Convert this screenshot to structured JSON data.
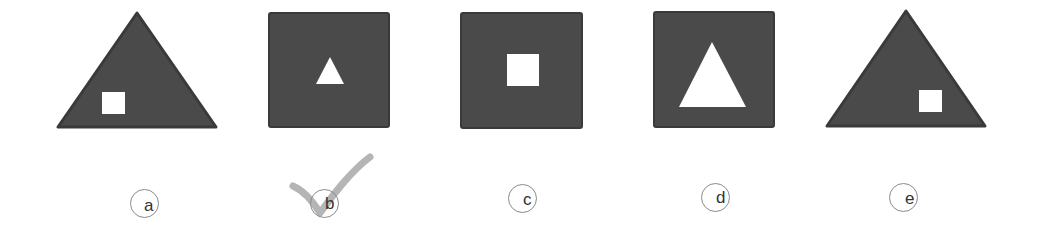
{
  "puzzle": {
    "colors": {
      "shape_fill": "#4a4a4a",
      "shape_stroke": "#3a3a3a",
      "inner_fill": "#ffffff",
      "circle_stroke": "#8a8a8a",
      "check_color": "#a8a8a8"
    },
    "options": [
      {
        "label": "a",
        "outer": "triangle",
        "inner": "square",
        "inner_position": "bottom-left",
        "selected": false
      },
      {
        "label": "b",
        "outer": "square",
        "inner": "triangle",
        "inner_size": "small",
        "selected": true
      },
      {
        "label": "c",
        "outer": "square",
        "inner": "square",
        "inner_size": "medium",
        "selected": false
      },
      {
        "label": "d",
        "outer": "square",
        "inner": "triangle",
        "inner_size": "large",
        "selected": false
      },
      {
        "label": "e",
        "outer": "triangle",
        "inner": "square",
        "inner_position": "bottom-right",
        "selected": false
      }
    ],
    "selected_answer": "b",
    "selection_mark_icon": "checkmark-icon"
  }
}
